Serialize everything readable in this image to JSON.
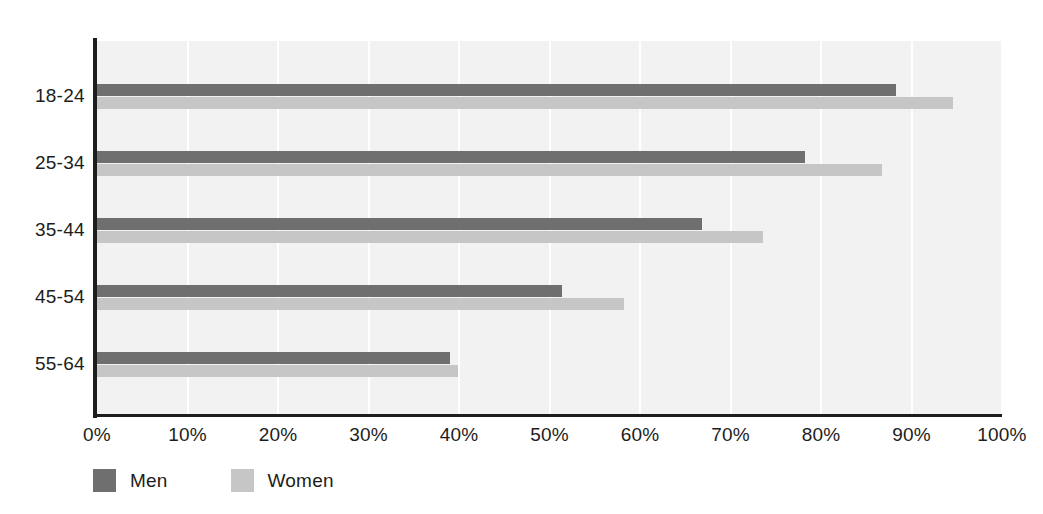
{
  "chart_data": {
    "type": "bar",
    "orientation": "horizontal",
    "title": "",
    "xlabel": "",
    "ylabel": "",
    "categories": [
      "18-24",
      "25-34",
      "35-44",
      "45-54",
      "55-64"
    ],
    "series": [
      {
        "name": "Men",
        "color": "#706f6f",
        "values": [
          88.3,
          78.2,
          66.9,
          51.4,
          39.0
        ]
      },
      {
        "name": "Women",
        "color": "#c6c6c6",
        "values": [
          94.6,
          86.7,
          73.6,
          58.2,
          39.9
        ]
      }
    ],
    "xlim": [
      0,
      100
    ],
    "xticks": [
      0,
      10,
      20,
      30,
      40,
      50,
      60,
      70,
      80,
      90,
      100
    ],
    "xtick_labels": [
      "0%",
      "10%",
      "20%",
      "30%",
      "40%",
      "50%",
      "60%",
      "70%",
      "80%",
      "90%",
      "100%"
    ],
    "grid": "vertical-only",
    "plot_background": "#f2f2f2",
    "gridline_color": "#ffffff",
    "axis_color": "#1d1d1b",
    "legend_position": "bottom-left"
  },
  "legend": {
    "items": [
      {
        "label": "Men",
        "color": "#706f6f"
      },
      {
        "label": "Women",
        "color": "#c6c6c6"
      }
    ]
  }
}
